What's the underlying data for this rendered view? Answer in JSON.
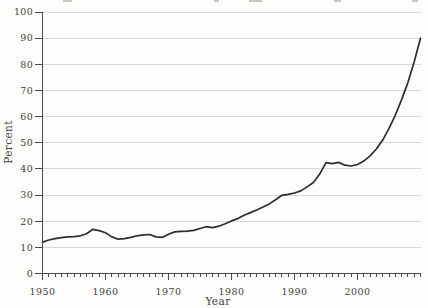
{
  "figure": {
    "y_axis_title": "Percent",
    "x_axis_title": "Year"
  },
  "chart_data": {
    "type": "line",
    "title": "",
    "xlabel": "Year",
    "ylabel": "Percent",
    "xlim": [
      1950,
      2010
    ],
    "ylim": [
      0,
      100
    ],
    "grid": "horizontal",
    "legend": "none",
    "line_color": "#2d2d2d",
    "grid_color": "#d9d9d4",
    "axis_color": "#4a4a47",
    "text_color": "#3f3f3d",
    "y_ticks": [
      0,
      10,
      20,
      30,
      40,
      50,
      60,
      70,
      80,
      90,
      100
    ],
    "y_tick_labels": [
      "0",
      "10",
      "20",
      "30",
      "40",
      "50",
      "60",
      "70",
      "80",
      "90",
      "100"
    ],
    "x_major_ticks": [
      1950,
      1960,
      1970,
      1980,
      1990,
      2000
    ],
    "x_tick_labels": [
      "1950",
      "1960",
      "1970",
      "1980",
      "1990",
      "2000"
    ],
    "x_minor_tick_interval": 1,
    "x": [
      1950,
      1951,
      1952,
      1953,
      1954,
      1955,
      1956,
      1957,
      1958,
      1959,
      1960,
      1961,
      1962,
      1963,
      1964,
      1965,
      1966,
      1967,
      1968,
      1969,
      1970,
      1971,
      1972,
      1973,
      1974,
      1975,
      1976,
      1977,
      1978,
      1979,
      1980,
      1981,
      1982,
      1983,
      1984,
      1985,
      1986,
      1987,
      1988,
      1989,
      1990,
      1991,
      1992,
      1993,
      1994,
      1995,
      1996,
      1997,
      1998,
      1999,
      2000,
      2001,
      2002,
      2003,
      2004,
      2005,
      2006,
      2007,
      2008,
      2009,
      2010
    ],
    "series": [
      {
        "name": "Percent",
        "values": [
          12.0,
          12.8,
          13.3,
          13.7,
          14.0,
          14.1,
          14.4,
          15.2,
          16.9,
          16.4,
          15.6,
          14.0,
          13.1,
          13.3,
          13.8,
          14.4,
          14.8,
          14.9,
          14.0,
          13.8,
          15.0,
          15.9,
          16.1,
          16.2,
          16.5,
          17.2,
          17.9,
          17.5,
          18.1,
          19.0,
          20.1,
          21.0,
          22.3,
          23.3,
          24.3,
          25.4,
          26.6,
          28.2,
          29.9,
          30.3,
          30.8,
          31.6,
          33.1,
          34.8,
          38.0,
          42.4,
          42.0,
          42.5,
          41.4,
          41.1,
          41.7,
          43.0,
          45.0,
          47.6,
          51.0,
          55.5,
          60.5,
          66.5,
          73.0,
          81.0,
          90.0
        ]
      }
    ]
  }
}
